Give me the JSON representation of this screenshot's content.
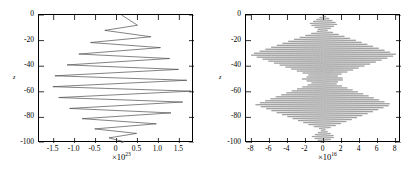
{
  "figure": {
    "background": "#ffffff",
    "line_color": "#4d4d4d",
    "axis_color": "#000000"
  },
  "panels": [
    {
      "id": "left-panel",
      "ylabel": "z",
      "y_ticks": [
        "0",
        "-20",
        "-40",
        "-60",
        "-80",
        "-100"
      ],
      "x_ticks": [
        "-1.5",
        "-1.0",
        "-0.5",
        "0",
        "0.5",
        "1.0",
        "1.5"
      ],
      "exponent_prefix": "×10",
      "exponent_value": "23"
    },
    {
      "id": "right-panel",
      "ylabel": "z",
      "y_ticks": [
        "0",
        "-20",
        "-40",
        "-60",
        "-80",
        "-100"
      ],
      "x_ticks": [
        "-8",
        "-6",
        "-4",
        "-2",
        "0",
        "2",
        "4",
        "6",
        "8"
      ],
      "exponent_prefix": "×10",
      "exponent_value": "16"
    }
  ],
  "chart_data": [
    {
      "type": "line",
      "title": "",
      "xlabel": "",
      "ylabel": "z",
      "x_scale_exponent": 23,
      "xlim": [
        -1.85,
        1.85
      ],
      "ylim": [
        -100,
        0
      ],
      "x_ticks": [
        -1.5,
        -1.0,
        -0.5,
        0,
        0.5,
        1.0,
        1.5
      ],
      "y_ticks": [
        0,
        -20,
        -40,
        -60,
        -80,
        -100
      ],
      "grid": false,
      "legend": "none",
      "description": "Sawtooth / zigzag waveform versus depth z; amplitude grows from near zero at z=0 to a maximum near z=-50 then decays toward z=-100",
      "series": [
        {
          "name": "zigzag",
          "points": [
            [
              0.12,
              0.0
            ],
            [
              0.5,
              -8.0
            ],
            [
              -0.28,
              -12.0
            ],
            [
              0.82,
              -17.0
            ],
            [
              -0.62,
              -21.5
            ],
            [
              1.05,
              -25.5
            ],
            [
              -0.9,
              -30.5
            ],
            [
              1.27,
              -34.0
            ],
            [
              -1.18,
              -39.0
            ],
            [
              1.48,
              -42.5
            ],
            [
              -1.47,
              -47.5
            ],
            [
              1.68,
              -51.0
            ],
            [
              -1.52,
              -56.0
            ],
            [
              1.78,
              -59.5
            ],
            [
              -1.38,
              -64.5
            ],
            [
              1.58,
              -68.0
            ],
            [
              -1.12,
              -73.0
            ],
            [
              1.3,
              -76.5
            ],
            [
              -0.82,
              -81.0
            ],
            [
              0.95,
              -85.0
            ],
            [
              -0.52,
              -89.0
            ],
            [
              0.48,
              -92.5
            ],
            [
              -0.18,
              -96.0
            ],
            [
              0.18,
              -99.0
            ],
            [
              0.1,
              -100.0
            ]
          ]
        }
      ]
    },
    {
      "type": "line",
      "title": "",
      "xlabel": "",
      "ylabel": "z",
      "x_scale_exponent": 16,
      "xlim": [
        -8.6,
        8.6
      ],
      "ylim": [
        -100,
        0
      ],
      "x_ticks": [
        -8,
        -6,
        -4,
        -2,
        0,
        2,
        4,
        6,
        8
      ],
      "y_ticks": [
        0,
        -20,
        -40,
        -60,
        -80,
        -100
      ],
      "grid": false,
      "legend": "none",
      "description": "High frequency oscillation versus depth z modulated by a two-lobe envelope; lens shaped lobes centred near z=-31 and z=-70 reaching x ~ +/-8e16, with small secondary nodes near z=-5, z=-50 and z=-95",
      "envelope": {
        "form": "sum of lens-shaped lobes",
        "lobes": [
          {
            "center_z": -31,
            "half_height_z": 20,
            "peak_amplitude": 8.2
          },
          {
            "center_z": -70,
            "half_height_z": 20,
            "peak_amplitude": 7.6
          },
          {
            "center_z": -50,
            "half_height_z": 7,
            "peak_amplitude": 2.4
          },
          {
            "center_z": -7,
            "half_height_z": 7,
            "peak_amplitude": 1.6
          },
          {
            "center_z": -95,
            "half_height_z": 6,
            "peak_amplitude": 1.3
          }
        ],
        "oscillation_period_z": 1.55
      }
    }
  ]
}
